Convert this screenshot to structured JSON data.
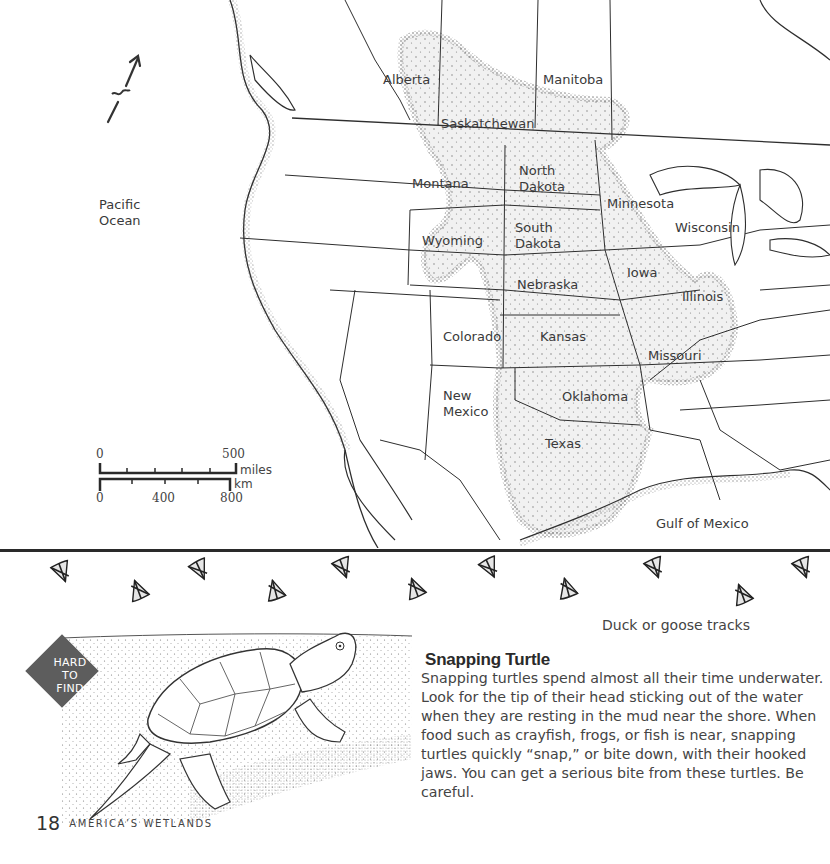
{
  "map": {
    "ocean_labels": [
      {
        "id": "pacific",
        "text": "Pacific\nOcean",
        "x": 99,
        "y": 197
      },
      {
        "id": "gulf",
        "text": "Gulf of Mexico",
        "x": 656,
        "y": 516
      }
    ],
    "region_labels": [
      {
        "id": "alberta",
        "text": "Alberta",
        "x": 383,
        "y": 72
      },
      {
        "id": "manitoba",
        "text": "Manitoba",
        "x": 543,
        "y": 72
      },
      {
        "id": "saskatchewan",
        "text": "Saskatchewan",
        "x": 441,
        "y": 116
      },
      {
        "id": "north-dakota",
        "text": "North\nDakota",
        "x": 519,
        "y": 163
      },
      {
        "id": "montana",
        "text": "Montana",
        "x": 412,
        "y": 176
      },
      {
        "id": "minnesota",
        "text": "Minnesota",
        "x": 607,
        "y": 196
      },
      {
        "id": "wisconsin",
        "text": "Wisconsin",
        "x": 675,
        "y": 220
      },
      {
        "id": "south-dakota",
        "text": "South\nDakota",
        "x": 515,
        "y": 220
      },
      {
        "id": "wyoming",
        "text": "Wyoming",
        "x": 422,
        "y": 233
      },
      {
        "id": "iowa",
        "text": "Iowa",
        "x": 627,
        "y": 265
      },
      {
        "id": "nebraska",
        "text": "Nebraska",
        "x": 517,
        "y": 277
      },
      {
        "id": "illinois",
        "text": "Illinois",
        "x": 682,
        "y": 289
      },
      {
        "id": "colorado",
        "text": "Colorado",
        "x": 443,
        "y": 329
      },
      {
        "id": "kansas",
        "text": "Kansas",
        "x": 540,
        "y": 329
      },
      {
        "id": "missouri",
        "text": "Missouri",
        "x": 648,
        "y": 348
      },
      {
        "id": "new-mexico",
        "text": "New\nMexico",
        "x": 443,
        "y": 388
      },
      {
        "id": "oklahoma",
        "text": "Oklahoma",
        "x": 562,
        "y": 389
      },
      {
        "id": "texas",
        "text": "Texas",
        "x": 545,
        "y": 436
      }
    ],
    "compass": {
      "icon": "north-arrow-icon"
    },
    "scale_bar": {
      "miles": {
        "start": "0",
        "end": "500",
        "unit": "miles"
      },
      "km": {
        "start": "0",
        "mid": "400",
        "end": "800",
        "unit": "km"
      }
    },
    "range_fill_color": "#ececec",
    "line_color": "#2e2e2e"
  },
  "tracks": {
    "caption": "Duck or goose tracks",
    "icon": "duck-track-icon",
    "positions": [
      {
        "x": 62,
        "y": 572,
        "r": -20
      },
      {
        "x": 138,
        "y": 590,
        "r": 160
      },
      {
        "x": 200,
        "y": 570,
        "r": -25
      },
      {
        "x": 275,
        "y": 590,
        "r": 165
      },
      {
        "x": 343,
        "y": 568,
        "r": -20
      },
      {
        "x": 415,
        "y": 588,
        "r": 160
      },
      {
        "x": 490,
        "y": 568,
        "r": -25
      },
      {
        "x": 567,
        "y": 588,
        "r": 165
      },
      {
        "x": 655,
        "y": 568,
        "r": -20
      },
      {
        "x": 742,
        "y": 594,
        "r": 160
      },
      {
        "x": 803,
        "y": 568,
        "r": -20
      }
    ]
  },
  "species_card": {
    "badge": "HARD\nTO\nFIND",
    "badge_color": "#5d5d5d",
    "title": "Snapping Turtle",
    "body": "Snapping turtles spend almost all their time underwater. Look for the tip of their head sticking out of the water when they are resting in the mud near the shore. When food such as crayfish, frogs, or fish is near, snapping turtles quickly “snap,” or bite down, with their hooked jaws. You can get a serious bite from these turtles. Be careful.",
    "illustration": "snapping-turtle-illustration"
  },
  "footer": {
    "page_number": "18",
    "running_title": "AMERICA’S WETLANDS"
  }
}
